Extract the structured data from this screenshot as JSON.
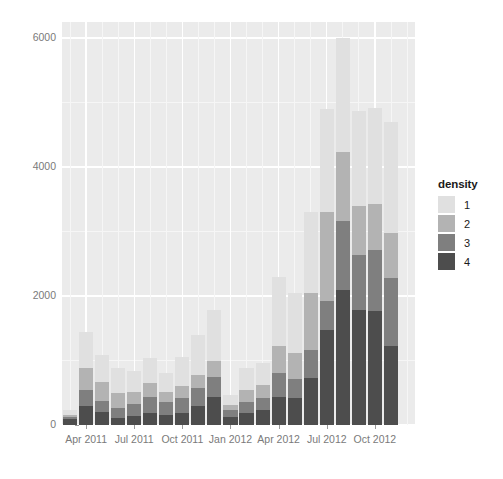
{
  "chart_data": {
    "type": "bar",
    "stacked": true,
    "title": "",
    "xlabel": "",
    "ylabel": "Number of documented killings",
    "ylim": [
      0,
      6000
    ],
    "yticks": [
      0,
      2000,
      4000,
      6000
    ],
    "ytick_labels": [
      "0",
      "2000",
      "4000",
      "6000"
    ],
    "grid": true,
    "legend_title": "density",
    "legend_position": "right",
    "categories": [
      "Mar 2011",
      "Apr 2011",
      "May 2011",
      "Jun 2011",
      "Jul 2011",
      "Aug 2011",
      "Sep 2011",
      "Oct 2011",
      "Nov 2011",
      "Dec 2011",
      "Jan 2012",
      "Feb 2012",
      "Mar 2012",
      "Apr 2012",
      "May 2012",
      "Jun 2012",
      "Jul 2012",
      "Aug 2012",
      "Sep 2012",
      "Oct 2012",
      "Nov 2012",
      "Dec 2012"
    ],
    "xtick_labels": [
      "Apr 2011",
      "Jul 2011",
      "Oct 2011",
      "Jan 2012",
      "Apr 2012",
      "Jul 2012",
      "Oct 2012"
    ],
    "xtick_categories": [
      "Apr 2011",
      "Jul 2011",
      "Oct 2011",
      "Jan 2012",
      "Apr 2012",
      "Jul 2012",
      "Oct 2012"
    ],
    "series": [
      {
        "name": "4",
        "label": "4",
        "color": "#4d4d4d",
        "values": [
          90,
          300,
          200,
          110,
          140,
          190,
          150,
          190,
          290,
          440,
          120,
          190,
          230,
          430,
          420,
          730,
          1470,
          2090,
          1780,
          1770,
          1220,
          0
        ]
      },
      {
        "name": "3",
        "label": "3",
        "color": "#7f7f7f",
        "values": [
          40,
          250,
          180,
          160,
          190,
          250,
          200,
          230,
          290,
          300,
          110,
          170,
          190,
          370,
          300,
          430,
          460,
          1080,
          850,
          940,
          1060,
          0
        ]
      },
      {
        "name": "2",
        "label": "2",
        "color": "#b3b3b3",
        "values": [
          30,
          330,
          290,
          220,
          180,
          210,
          160,
          180,
          200,
          260,
          80,
          180,
          200,
          420,
          400,
          880,
          1370,
          1060,
          760,
          720,
          700,
          0
        ]
      },
      {
        "name": "1",
        "label": "1",
        "color": "#e0e0e0",
        "values": [
          70,
          560,
          420,
          390,
          320,
          390,
          300,
          460,
          610,
          790,
          160,
          340,
          340,
          1080,
          930,
          1260,
          1600,
          1770,
          1480,
          1480,
          1720,
          0
        ]
      }
    ],
    "totals": [
      230,
      1440,
      1090,
      880,
      830,
      1040,
      810,
      1060,
      1390,
      1790,
      470,
      880,
      960,
      2300,
      2050,
      3300,
      4900,
      6000,
      4870,
      4910,
      4700,
      0
    ]
  },
  "legend": {
    "title": "density",
    "items": [
      {
        "label": "1",
        "color": "#e0e0e0"
      },
      {
        "label": "2",
        "color": "#b3b3b3"
      },
      {
        "label": "3",
        "color": "#7f7f7f"
      },
      {
        "label": "4",
        "color": "#4d4d4d"
      }
    ]
  },
  "axes": {
    "y_title": "Number of documented killings",
    "y_tick_labels": [
      "6000",
      "4000",
      "2000",
      "0"
    ],
    "x_tick_labels": [
      "Apr 2011",
      "Jul 2011",
      "Oct 2011",
      "Jan 2012",
      "Apr 2012",
      "Jul 2012",
      "Oct 2012"
    ]
  },
  "style": {
    "panel_background": "#ebebeb",
    "gridline_major": "#ffffff",
    "gridline_minor": "#f6f6f6",
    "page_background": "#ffffff",
    "axis_text": "#7a7a7a",
    "title_text": "#1a1a1a"
  }
}
